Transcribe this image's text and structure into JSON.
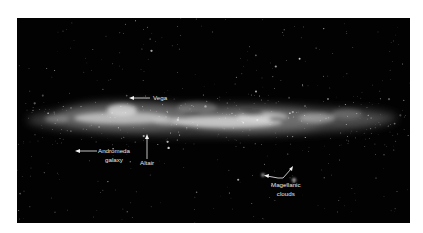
{
  "figure": {
    "background_color": "#020202",
    "band_color": "#d8d8d8",
    "label_color": "#e6e6e6",
    "labels": {
      "vega": "Vega",
      "andromeda_line1": "Andromeda",
      "andromeda_line2": "galaxy",
      "altair": "Altair",
      "magellanic_line1": "Magellanic",
      "magellanic_line2": "clouds"
    }
  }
}
